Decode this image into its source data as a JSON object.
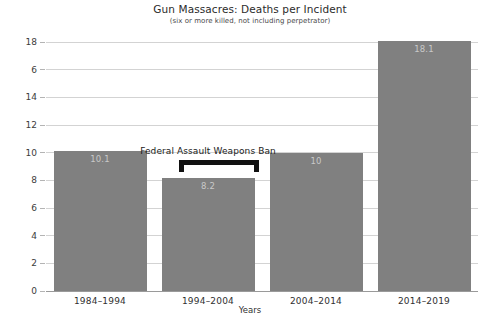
{
  "chart_data": {
    "type": "bar",
    "title": "Gun Massacres: Deaths per Incident",
    "subtitle": "(six or more killed, not including perpetrator)",
    "xlabel": "Years",
    "ylabel": "",
    "categories": [
      "1984–1994",
      "1994–2004",
      "2004–2014",
      "2014–2019"
    ],
    "values": [
      10.1,
      8.2,
      10,
      18.1
    ],
    "value_labels": [
      "10.1",
      "8.2",
      "10",
      "18.1"
    ],
    "ylim": [
      0,
      18
    ],
    "yticks": [
      0,
      2,
      4,
      6,
      8,
      10,
      12,
      14,
      16,
      18
    ],
    "ytick_labels": [
      "0",
      "2",
      "4",
      "6",
      "8",
      "10",
      "12",
      "14",
      "6",
      "18"
    ],
    "grid": true,
    "legend": "none",
    "bar_color": "#808080",
    "value_label_color": "#c9c9c9",
    "gridline_color": "#d3d3d3",
    "annotations": [
      {
        "text": "Federal Assault Weapons Ban",
        "covers_category": "1994–2004",
        "bracket_color": "#111111"
      }
    ]
  }
}
